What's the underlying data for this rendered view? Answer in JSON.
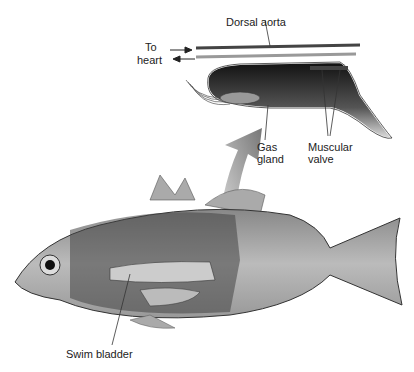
{
  "diagram": {
    "labels": {
      "dorsal_aorta": "Dorsal aorta",
      "to_heart_line1": "To",
      "to_heart_line2": "heart",
      "gas_gland_line1": "Gas",
      "gas_gland_line2": "gland",
      "muscular_valve_line1": "Muscular",
      "muscular_valve_line2": "valve",
      "swim_bladder": "Swim bladder"
    },
    "colors": {
      "line": "#333333",
      "bladder_dark": "#1a1a1a",
      "body_gray": "#9a9a9a",
      "arrow_gray": "#8a8a8a"
    }
  }
}
